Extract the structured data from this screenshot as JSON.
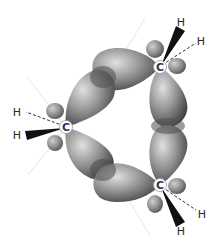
{
  "diagram": {
    "atoms": {
      "carbon_top": {
        "label": "C",
        "x": 160,
        "y": 67
      },
      "carbon_left": {
        "label": "C",
        "x": 66,
        "y": 127
      },
      "carbon_bottom": {
        "label": "C",
        "x": 160,
        "y": 185
      },
      "h_top_wedge": {
        "label": "H",
        "x": 181,
        "y": 22
      },
      "h_top_dash": {
        "label": "H",
        "x": 201,
        "y": 41
      },
      "h_left_dash": {
        "label": "H",
        "x": 17,
        "y": 112
      },
      "h_left_wedge": {
        "label": "H",
        "x": 17,
        "y": 135
      },
      "h_bottom_dash": {
        "label": "H",
        "x": 202,
        "y": 214
      },
      "h_bottom_wedge": {
        "label": "H",
        "x": 181,
        "y": 231
      }
    },
    "colors": {
      "lobe": "#8a8a8a",
      "lobe_highlight": "#d8d8d8",
      "lobe_dark": "#4a4a4a",
      "overlap": "#5a5a5a",
      "guide_line": "#e4e4e4",
      "wedge": "#111111"
    }
  }
}
